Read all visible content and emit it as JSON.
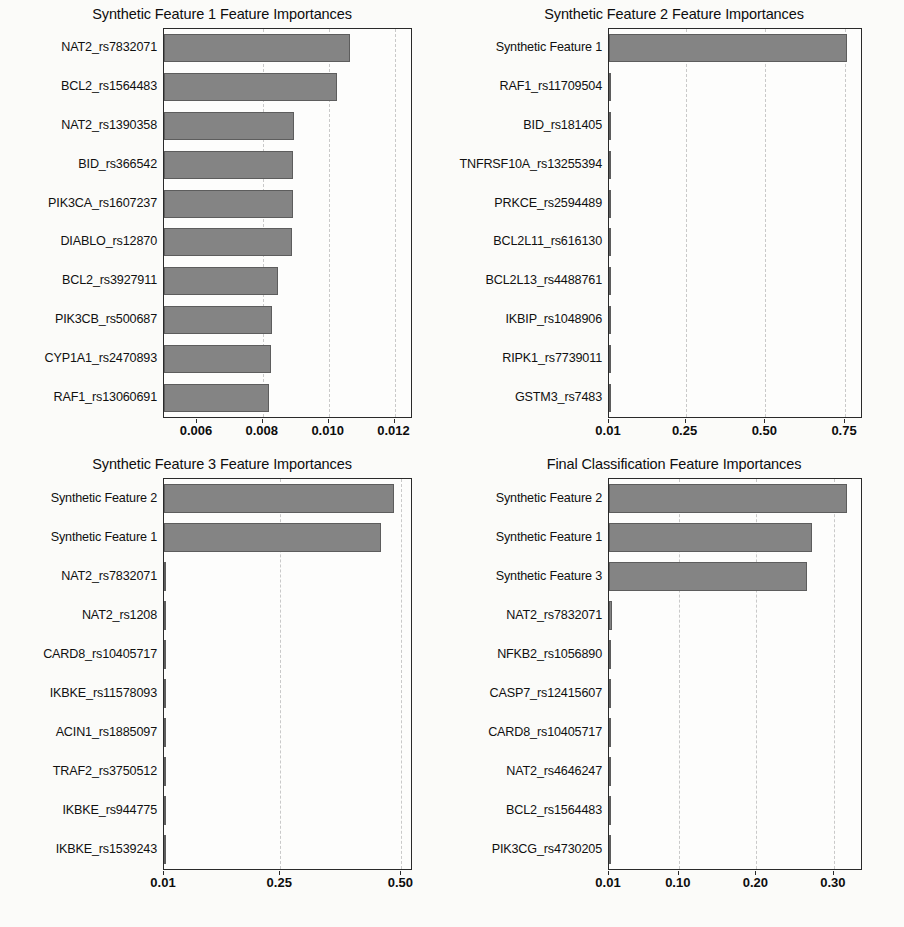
{
  "figure": {
    "background_color": "#fbfbf9",
    "bar_color": "#848484",
    "bar_edge_color": "#5d5d5d",
    "axis_color": "#2a2a2a",
    "gridline_color": "#c9c9c9"
  },
  "chart_data": [
    {
      "id": "panel-1",
      "type": "bar",
      "orientation": "horizontal",
      "title": "Synthetic Feature 1 Feature Importances",
      "xlabel": "",
      "ylabel": "",
      "xlim": [
        0.005,
        0.0125
      ],
      "xticks": [
        0.006,
        0.008,
        0.01,
        0.012
      ],
      "xticklabels": [
        "0.006",
        "0.008",
        "0.010",
        "0.012"
      ],
      "grid": true,
      "legend": null,
      "categories": [
        "NAT2_rs7832071",
        "BCL2_rs1564483",
        "NAT2_rs1390358",
        "BID_rs366542",
        "PIK3CA_rs1607237",
        "DIABLO_rs12870",
        "BCL2_rs3927911",
        "PIK3CB_rs500687",
        "CYP1A1_rs2470893",
        "RAF1_rs13060691"
      ],
      "values": [
        0.01065,
        0.01025,
        0.00895,
        0.00893,
        0.00892,
        0.0089,
        0.00845,
        0.00828,
        0.00825,
        0.00818
      ]
    },
    {
      "id": "panel-2",
      "type": "bar",
      "orientation": "horizontal",
      "title": "Synthetic Feature 2 Feature Importances",
      "xlabel": "",
      "ylabel": "",
      "xlim": [
        0.01,
        0.8
      ],
      "xticks": [
        0.01,
        0.25,
        0.5,
        0.75
      ],
      "xticklabels": [
        "0.01",
        "0.25",
        "0.50",
        "0.75"
      ],
      "grid": true,
      "legend": null,
      "categories": [
        "Synthetic Feature 1",
        "RAF1_rs11709504",
        "BID_rs181405",
        "TNFRSF10A_rs13255394",
        "PRKCE_rs2594489",
        "BCL2L11_rs616130",
        "BCL2L13_rs4488761",
        "IKBIP_rs1048906",
        "RIPK1_rs7739011",
        "GSTM3_rs7483"
      ],
      "values": [
        0.757,
        0.013,
        0.012,
        0.012,
        0.012,
        0.011,
        0.011,
        0.011,
        0.011,
        0.011
      ]
    },
    {
      "id": "panel-3",
      "type": "bar",
      "orientation": "horizontal",
      "title": "Synthetic Feature 3 Feature Importances",
      "xlabel": "",
      "ylabel": "",
      "xlim": [
        0.01,
        0.52
      ],
      "xticks": [
        0.01,
        0.25,
        0.5
      ],
      "xticklabels": [
        "0.01",
        "0.25",
        "0.50"
      ],
      "grid": true,
      "legend": null,
      "categories": [
        "Synthetic Feature 2",
        "Synthetic Feature 1",
        "NAT2_rs7832071",
        "NAT2_rs1208",
        "CARD8_rs10405717",
        "IKBKE_rs11578093",
        "ACIN1_rs1885097",
        "TRAF2_rs3750512",
        "IKBKE_rs944775",
        "IKBKE_rs1539243"
      ],
      "values": [
        0.484,
        0.458,
        0.014,
        0.012,
        0.012,
        0.012,
        0.011,
        0.011,
        0.011,
        0.011
      ]
    },
    {
      "id": "panel-4",
      "type": "bar",
      "orientation": "horizontal",
      "title": "Final Classification Feature Importances",
      "xlabel": "",
      "ylabel": "",
      "xlim": [
        0.01,
        0.335
      ],
      "xticks": [
        0.01,
        0.1,
        0.2,
        0.3
      ],
      "xticklabels": [
        "0.01",
        "0.10",
        "0.20",
        "0.30"
      ],
      "grid": true,
      "legend": null,
      "categories": [
        "Synthetic Feature 2",
        "Synthetic Feature 1",
        "Synthetic Feature 3",
        "NAT2_rs7832071",
        "NFKB2_rs1056890",
        "CASP7_rs12415607",
        "CARD8_rs10405717",
        "NAT2_rs4646247",
        "BCL2_rs1564483",
        "PIK3CG_rs4730205"
      ],
      "values": [
        0.317,
        0.272,
        0.266,
        0.0135,
        0.013,
        0.013,
        0.013,
        0.013,
        0.012,
        0.012
      ]
    }
  ]
}
